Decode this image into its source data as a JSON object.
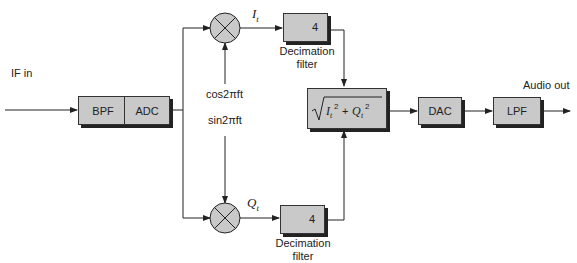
{
  "diagram": {
    "input_label": "IF in",
    "output_label": "Audio out",
    "blocks": {
      "bpf": "BPF",
      "adc": "ADC",
      "dac": "DAC",
      "lpf": "LPF",
      "magnitude": "√(I_t² + Q_t²)",
      "decim_top_factor": "4",
      "decim_bottom_factor": "4"
    },
    "decimation_label_line1": "Decimation",
    "decimation_label_line2": "filter",
    "signals": {
      "i": "I",
      "i_sub": "t",
      "q": "Q",
      "q_sub": "t",
      "cos": "cos2πft",
      "sin": "sin2πft"
    },
    "colors": {
      "block_fill": "#c9c9c9",
      "line": "#222222",
      "shadow": "#222222"
    }
  }
}
